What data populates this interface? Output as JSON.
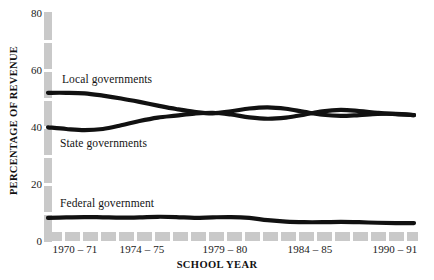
{
  "chart_data": {
    "type": "line",
    "title": "",
    "xlabel": "SCHOOL YEAR",
    "ylabel": "PERCENTAGE OF REVENUE",
    "ylim": [
      0,
      80
    ],
    "yticks": [
      0,
      20,
      40,
      60,
      80
    ],
    "ytick_labels": [
      "0",
      "20",
      "40",
      "60",
      "80"
    ],
    "xticks": [
      "1970 – 71",
      "1974 – 75",
      "1979 – 80",
      "1984 – 85",
      "1990 – 91"
    ],
    "xtick_values": [
      1970,
      1974,
      1979,
      1984,
      1990
    ],
    "x": [
      1970,
      1971,
      1972,
      1973,
      1974,
      1975,
      1976,
      1977,
      1978,
      1979,
      1980,
      1981,
      1982,
      1983,
      1984,
      1985,
      1986,
      1987,
      1988,
      1989,
      1990
    ],
    "x_labels": [
      "1970 – 71",
      "1971 – 72",
      "1972 – 73",
      "1973 – 74",
      "1974 – 75",
      "1975 – 76",
      "1976 – 77",
      "1977 – 78",
      "1978 – 79",
      "1979 – 80",
      "1980 – 81",
      "1981 – 82",
      "1982 – 83",
      "1983 – 84",
      "1984 – 85",
      "1985 – 86",
      "1986 – 87",
      "1987 – 88",
      "1988 – 89",
      "1989 – 90",
      "1990 – 91"
    ],
    "grid": false,
    "legend_position": "inline-annotations",
    "line_color": "#111111",
    "axis_color": "#c9c9c9",
    "series": [
      {
        "name": "Local governments",
        "label": "Local governments",
        "values": [
          52.0,
          52.0,
          51.8,
          51.0,
          50.0,
          48.8,
          47.5,
          46.3,
          45.3,
          44.8,
          45.5,
          46.5,
          46.9,
          46.4,
          45.3,
          44.3,
          43.9,
          44.2,
          44.6,
          44.6,
          44.2
        ]
      },
      {
        "name": "State governments",
        "label": "State governments",
        "values": [
          39.9,
          39.3,
          38.9,
          39.3,
          40.6,
          42.1,
          43.3,
          44.0,
          44.7,
          45.0,
          44.4,
          43.4,
          42.9,
          43.3,
          44.3,
          45.5,
          46.0,
          45.6,
          45.0,
          44.5,
          44.2
        ]
      },
      {
        "name": "Federal government",
        "label": "Federal government",
        "values": [
          8.1,
          8.3,
          8.4,
          8.3,
          8.2,
          8.3,
          8.5,
          8.4,
          8.1,
          8.3,
          8.4,
          8.1,
          7.3,
          6.8,
          6.6,
          6.6,
          6.7,
          6.6,
          6.4,
          6.3,
          6.3
        ]
      }
    ]
  },
  "axes": {
    "y_title": "PERCENTAGE OF REVENUE",
    "x_title": "SCHOOL YEAR"
  }
}
